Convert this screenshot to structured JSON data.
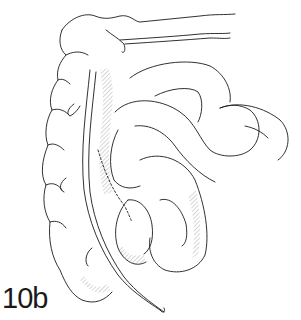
{
  "figure": {
    "label": "10b",
    "line_color": "#1a1a1a",
    "background": "#ffffff"
  }
}
